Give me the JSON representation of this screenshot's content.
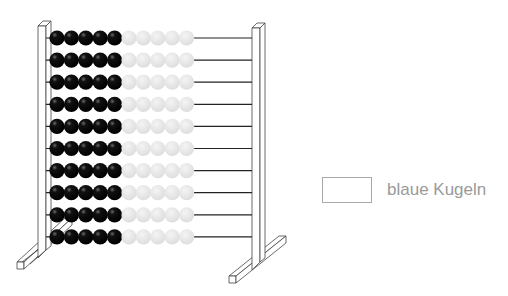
{
  "abacus": {
    "rows": 10,
    "beads_per_row": 10,
    "dark_beads_per_row": 5,
    "light_beads_per_row": 5,
    "colors": {
      "dark_bead": "#000000",
      "light_bead": "#e6e6e6",
      "frame": "#333333",
      "rod": "#222222"
    }
  },
  "answer": {
    "box_value": "",
    "label": "blaue Kugeln"
  }
}
